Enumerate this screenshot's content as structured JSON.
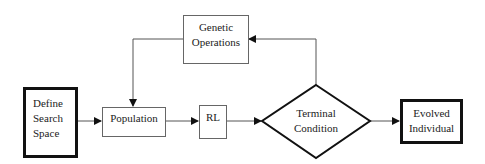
{
  "diagram": {
    "type": "flowchart",
    "nodes": {
      "define_search_space": {
        "label": "Define\nSearch\nSpace",
        "shape": "rectangle-thick"
      },
      "population": {
        "label": "Population",
        "shape": "rectangle"
      },
      "rl": {
        "label": "RL",
        "shape": "rectangle"
      },
      "genetic_operations": {
        "label": "Genetic\nOperations",
        "shape": "rectangle"
      },
      "terminal_condition": {
        "label": "Terminal\nCondition",
        "shape": "diamond"
      },
      "evolved_individual": {
        "label": "Evolved\nIndividual",
        "shape": "rectangle-thick"
      }
    },
    "edges": [
      {
        "from": "Define Search Space",
        "to": "Population"
      },
      {
        "from": "Population",
        "to": "RL"
      },
      {
        "from": "RL",
        "to": "Terminal Condition"
      },
      {
        "from": "Terminal Condition",
        "to": "Evolved Individual"
      },
      {
        "from": "Terminal Condition",
        "to": "Genetic Operations"
      },
      {
        "from": "Genetic Operations",
        "to": "Population"
      }
    ],
    "colors": {
      "line": "#555555",
      "thick_border": "#111111"
    }
  }
}
